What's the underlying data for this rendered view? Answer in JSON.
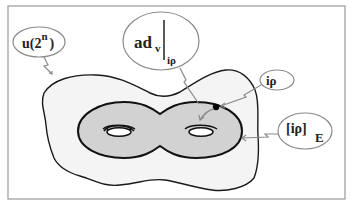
{
  "diagram": {
    "colors": {
      "frame": "#9a9a9a",
      "outer_region_fill": "#f4f4f4",
      "outer_region_stroke": "#1a1a1a",
      "torus_fill": "#d2d2d2",
      "torus_stroke": "#111111",
      "bubble_stroke": "#8a8a8a",
      "arrow": "#8a8a8a",
      "point": "#000000",
      "text": "#222222"
    },
    "labels": {
      "u2n": {
        "main": "u(2",
        "sup": "n",
        "close": ")"
      },
      "adv": {
        "main": "ad",
        "sub_v": "v",
        "sub_irho": "iρ"
      },
      "irho": {
        "main": "iρ"
      },
      "irhoE": {
        "main": "[iρ]",
        "sub": "E"
      }
    }
  }
}
